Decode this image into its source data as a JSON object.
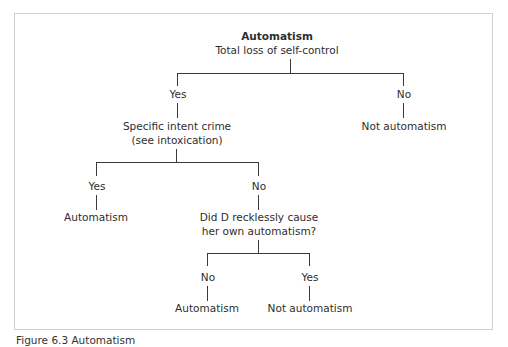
{
  "diagram": {
    "root": {
      "title": "Automatism",
      "question": "Total loss of self-control"
    },
    "level1": {
      "yes_label": "Yes",
      "no_label": "No",
      "no_result": "Not automatism",
      "yes_question_line1": "Specific intent crime",
      "yes_question_line2": "(see intoxication)"
    },
    "level2": {
      "yes_label": "Yes",
      "yes_result": "Automatism",
      "no_label": "No",
      "no_question_line1": "Did D recklessly cause",
      "no_question_line2": "her own automatism?"
    },
    "level3": {
      "no_label": "No",
      "no_result": "Automatism",
      "yes_label": "Yes",
      "yes_result": "Not automatism"
    }
  },
  "caption": "Figure 6.3 Automatism",
  "colors": {
    "frame_border": "#cfcfcf",
    "line": "#3a3a3a",
    "text": "#2e2e2e"
  }
}
